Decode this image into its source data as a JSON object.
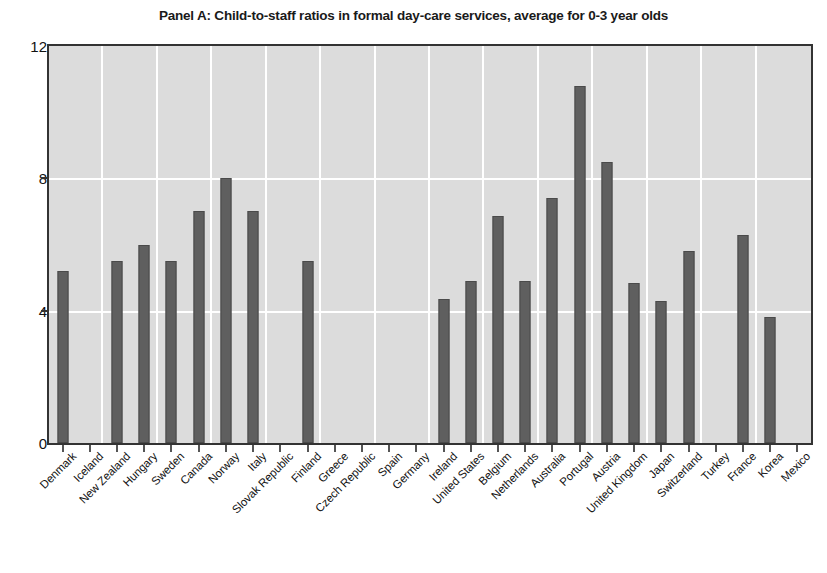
{
  "chart_data": {
    "type": "bar",
    "title": "Panel A: Child-to-staff ratios in formal day-care services, average for 0-3 year olds",
    "xlabel": "",
    "ylabel": "",
    "ylim": [
      0,
      12
    ],
    "yticks": [
      0,
      4,
      8,
      12
    ],
    "ytick_labels": [
      "0",
      "4",
      "8",
      "12"
    ],
    "grid": true,
    "legend": "none",
    "bar_color": "#5f5f5f",
    "plot_background": "#dcdcdc",
    "gridline_color": "#ffffff",
    "categories": [
      "Denmark",
      "Iceland",
      "New Zealand",
      "Hungary",
      "Sweden",
      "Canada",
      "Norway",
      "Italy",
      "Slovak Republic",
      "Finland",
      "Greece",
      "Czech Republic",
      "Spain",
      "Germany",
      "Ireland",
      "United States",
      "Belgium",
      "Netherlands",
      "Australia",
      "Portugal",
      "Austria",
      "United Kingdom",
      "Japan",
      "Switzerland",
      "Turkey",
      "France",
      "Korea",
      "Mexico"
    ],
    "values": [
      5.2,
      null,
      5.5,
      6.0,
      5.5,
      7.0,
      8.0,
      7.0,
      null,
      5.5,
      null,
      null,
      null,
      null,
      4.35,
      4.9,
      6.85,
      4.9,
      7.4,
      10.8,
      8.5,
      4.85,
      4.3,
      5.8,
      null,
      6.3,
      3.8,
      null
    ]
  }
}
